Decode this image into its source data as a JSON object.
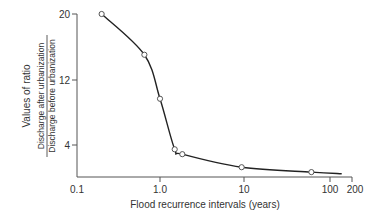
{
  "chart_data": {
    "type": "line",
    "title": "",
    "xlabel": "Flood recurrence intervals (years)",
    "ylabel": "Values of ratio",
    "ylabel_ratio": {
      "numerator": "Discharge after urbanization",
      "denominator": "Discharge before urbanization"
    },
    "x_scale": "log",
    "xlim": [
      0.1,
      200
    ],
    "ylim": [
      0,
      20
    ],
    "x_ticks": [
      "0.1",
      "1.0",
      "10",
      "100",
      "200"
    ],
    "y_ticks": [
      "20",
      "12",
      "4"
    ],
    "grid": false,
    "legend": null,
    "series": [
      {
        "name": "Ratio of discharge after/before urbanization",
        "points": [
          {
            "x": 0.2,
            "y": 20
          },
          {
            "x": 0.65,
            "y": 15
          },
          {
            "x": 1.0,
            "y": 9.6
          },
          {
            "x": 1.5,
            "y": 3.4
          },
          {
            "x": 1.85,
            "y": 2.8
          },
          {
            "x": 9.5,
            "y": 1.2
          },
          {
            "x": 65,
            "y": 0.6
          }
        ],
        "curve_end": {
          "x": 150,
          "y": 0.4
        }
      }
    ]
  }
}
